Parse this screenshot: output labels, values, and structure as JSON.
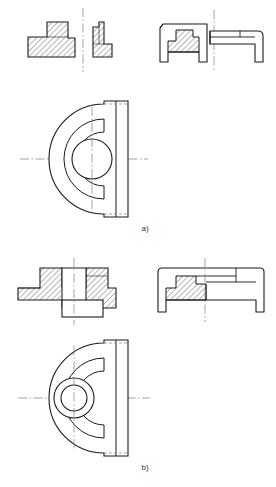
{
  "document": {
    "title": "Orthographic engineering drawing of a semicircular flange bracket",
    "type": "technical-drawing",
    "background_color": "#ffffff",
    "line_color": "#1a1a1a",
    "hatch_color": "#2a2a2a",
    "centerline_color": "#7a7a7a",
    "hidden_line_color": "#8a8a8a",
    "width_px": 276,
    "height_px": 487
  },
  "figures": [
    {
      "id": "a",
      "caption": "a)",
      "caption_x": 145,
      "caption_y": 231,
      "views": [
        {
          "name": "front-section-left",
          "description": "Left half sectional front view with 45-degree hatching, stepped profile",
          "hatched": true
        },
        {
          "name": "front-section-right-fragment",
          "description": "Small right fragment view separated by vertical centerline",
          "hatched": true
        },
        {
          "name": "side-section-view",
          "description": "Half-section side view with hatching and legs",
          "hatched": true
        },
        {
          "name": "side-outline-view",
          "description": "Outline side view without hatching",
          "hatched": false
        },
        {
          "name": "plan-semicircular-view",
          "description": "Semicircular plan view with single central bore and C-shaped slot",
          "hatched": false,
          "bore_circles": 1
        }
      ]
    },
    {
      "id": "b",
      "caption": "b)",
      "caption_x": 145,
      "caption_y": 470,
      "views": [
        {
          "name": "front-section-view",
          "description": "Sectional front view with central boss, counterbore and 45-degree hatching",
          "hatched": true
        },
        {
          "name": "side-section-view",
          "description": "Side half-section view with hatching, boss and legs",
          "hatched": true
        },
        {
          "name": "plan-semicircular-view",
          "description": "Semicircular plan view with two concentric bore circles and C-shaped slot",
          "hatched": false,
          "bore_circles": 2
        }
      ]
    }
  ],
  "annotations": {
    "centerline_style": "dash-dot",
    "hidden_line_style": "dashed",
    "hatch_angle_deg": 45,
    "hatch_spacing_px": 3
  }
}
